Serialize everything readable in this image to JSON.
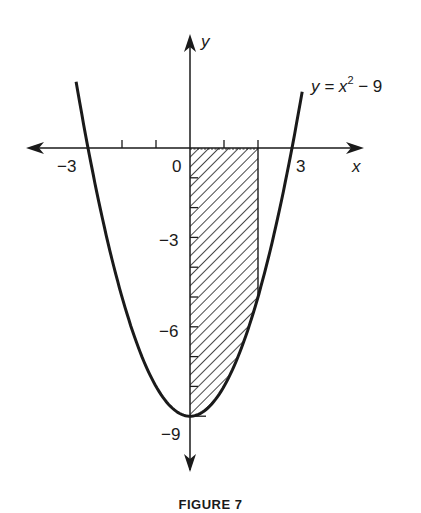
{
  "chart_data": {
    "type": "line",
    "title": "",
    "caption": "FIGURE 7",
    "function": "y = x^2 - 9",
    "curve_label": {
      "base": "y = x",
      "exponent": "2",
      "tail": " − 9"
    },
    "xlabel": "x",
    "ylabel": "y",
    "x_tick_labels": [
      {
        "value": -3,
        "label": "−3"
      },
      {
        "value": 0,
        "label": "0"
      },
      {
        "value": 3,
        "label": "3"
      }
    ],
    "y_tick_labels": [
      {
        "value": -3,
        "label": "−3"
      },
      {
        "value": -6,
        "label": "−6"
      },
      {
        "value": -9,
        "label": "−9"
      }
    ],
    "x_ticks": [
      -2,
      -1,
      1,
      2
    ],
    "y_ticks": [
      -1,
      -2,
      -3,
      -4,
      -5,
      -6,
      -7,
      -8,
      -9
    ],
    "xlim": [
      -4.6,
      4.5
    ],
    "ylim": [
      -10.5,
      3
    ],
    "grid": false,
    "legend": "none",
    "series": [
      {
        "name": "y = x^2 - 9",
        "x_range": [
          -3.35,
          3.3
        ],
        "points": [
          [
            -3,
            0
          ],
          [
            -2,
            -5
          ],
          [
            -1,
            -8
          ],
          [
            0,
            -9
          ],
          [
            1,
            -8
          ],
          [
            2,
            -5
          ],
          [
            3,
            0
          ]
        ]
      }
    ],
    "shaded_region": {
      "x_from": 0,
      "x_to": 2,
      "between": [
        "y = 0",
        "y = x^2 - 9"
      ],
      "pattern": "diagonal hatch"
    },
    "roots": [
      -3,
      3
    ],
    "vertex": [
      0,
      -9
    ]
  }
}
